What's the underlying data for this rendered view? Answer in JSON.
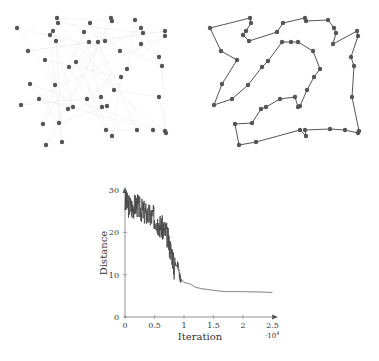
{
  "chart_data": [
    {
      "type": "scatter",
      "title": "",
      "description": "Random initial tour (faint edges) over city points",
      "point_color": "#555555",
      "edge_color": "#eeeeee",
      "points": [
        [
          17,
          28
        ],
        [
          57,
          18
        ],
        [
          58,
          23
        ],
        [
          53,
          31
        ],
        [
          50,
          35
        ],
        [
          56,
          41
        ],
        [
          90,
          23
        ],
        [
          84,
          32
        ],
        [
          89,
          42
        ],
        [
          98,
          42
        ],
        [
          105,
          41
        ],
        [
          111,
          18
        ],
        [
          112,
          21
        ],
        [
          135,
          20
        ],
        [
          141,
          28
        ],
        [
          143,
          33
        ],
        [
          141,
          44
        ],
        [
          165,
          31
        ],
        [
          165,
          36
        ],
        [
          28,
          51
        ],
        [
          45,
          60
        ],
        [
          76,
          62
        ],
        [
          69,
          67
        ],
        [
          120,
          51
        ],
        [
          127,
          69
        ],
        [
          121,
          77
        ],
        [
          159,
          57
        ],
        [
          162,
          66
        ],
        [
          30,
          84
        ],
        [
          55,
          85
        ],
        [
          114,
          90
        ],
        [
          39,
          99
        ],
        [
          21,
          105
        ],
        [
          87,
          99
        ],
        [
          101,
          97
        ],
        [
          68,
          109
        ],
        [
          73,
          107
        ],
        [
          102,
          107
        ],
        [
          107,
          106
        ],
        [
          159,
          97
        ],
        [
          43,
          124
        ],
        [
          59,
          123
        ],
        [
          106,
          130
        ],
        [
          112,
          136
        ],
        [
          137,
          130
        ],
        [
          153,
          130
        ],
        [
          165,
          131
        ],
        [
          166,
          133
        ],
        [
          46,
          145
        ],
        [
          62,
          142
        ]
      ]
    },
    {
      "type": "line",
      "title": "",
      "description": "Optimized closed tour through the same city points",
      "point_color": "#555555",
      "edge_color": "#555555",
      "tour": [
        [
          210,
          28
        ],
        [
          250,
          18
        ],
        [
          251,
          23
        ],
        [
          246,
          31
        ],
        [
          243,
          35
        ],
        [
          249,
          41
        ],
        [
          277,
          32
        ],
        [
          283,
          23
        ],
        [
          305,
          18
        ],
        [
          306,
          21
        ],
        [
          328,
          20
        ],
        [
          334,
          28
        ],
        [
          336,
          33
        ],
        [
          333,
          44
        ],
        [
          357,
          31
        ],
        [
          358,
          36
        ],
        [
          351,
          57
        ],
        [
          354,
          66
        ],
        [
          352,
          97
        ],
        [
          359,
          131
        ],
        [
          358,
          133
        ],
        [
          345,
          130
        ],
        [
          330,
          129
        ],
        [
          305,
          130
        ],
        [
          306,
          136
        ],
        [
          300,
          130
        ],
        [
          256,
          142
        ],
        [
          239,
          145
        ],
        [
          235,
          124
        ],
        [
          252,
          123
        ],
        [
          261,
          109
        ],
        [
          266,
          107
        ],
        [
          280,
          99
        ],
        [
          295,
          97
        ],
        [
          298,
          107
        ],
        [
          300,
          106
        ],
        [
          307,
          90
        ],
        [
          314,
          77
        ],
        [
          320,
          69
        ],
        [
          313,
          51
        ],
        [
          298,
          42
        ],
        [
          291,
          42
        ],
        [
          282,
          42
        ],
        [
          268,
          61
        ],
        [
          262,
          67
        ],
        [
          248,
          85
        ],
        [
          232,
          99
        ],
        [
          214,
          105
        ],
        [
          222,
          84
        ],
        [
          237,
          60
        ],
        [
          221,
          51
        ],
        [
          210,
          28
        ]
      ]
    },
    {
      "type": "line",
      "title": "",
      "xlabel": "Iteration",
      "ylabel": "Distance",
      "x_multiplier": "·10⁴",
      "xlim": [
        0,
        2.5
      ],
      "ylim": [
        0,
        30
      ],
      "xticks": [
        "0",
        "0.5",
        "1",
        "1.5",
        "2",
        "2.5"
      ],
      "yticks": [
        "0",
        "10",
        "20",
        "30"
      ],
      "grid": false,
      "series": [
        {
          "name": "Distance",
          "color": "#444444",
          "x": [
            0,
            0.1,
            0.2,
            0.3,
            0.4,
            0.5,
            0.6,
            0.7,
            0.75,
            0.8,
            0.83,
            0.87,
            0.9,
            0.93,
            0.95,
            1.0,
            1.1,
            1.2,
            1.3,
            1.5,
            1.7,
            2.0,
            2.3,
            2.5
          ],
          "values": [
            27,
            26,
            26.5,
            25,
            24,
            23.5,
            21.5,
            20,
            17,
            15,
            11.5,
            13,
            12,
            9.5,
            9,
            8.2,
            7.8,
            7,
            6.7,
            6.3,
            6.0,
            6.0,
            5.9,
            5.8
          ]
        }
      ]
    }
  ],
  "labels": {
    "xlabel": "Iteration",
    "ylabel": "Distance",
    "multiplier_base": "·10",
    "multiplier_exp": "4",
    "xticks": [
      "0",
      "0.5",
      "1",
      "1.5",
      "2",
      "2.5"
    ],
    "yticks": [
      "0",
      "10",
      "20",
      "30"
    ]
  }
}
